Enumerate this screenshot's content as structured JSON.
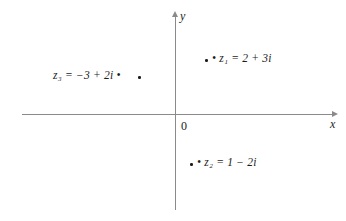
{
  "diagram": {
    "type": "complex-plane-argand-diagram",
    "axes": {
      "x_label": "x",
      "y_label": "y",
      "origin_label": "0"
    },
    "points": [
      {
        "id": "z1",
        "label": "• z₁ = 2 + 3i",
        "name": "z₁",
        "expression": "2 + 3i",
        "real": 2,
        "imaginary": 3,
        "dot_side": "left"
      },
      {
        "id": "z2",
        "label": "• z₂ = 1 − 2i",
        "name": "z₂",
        "expression": "1 − 2i",
        "real": 1,
        "imaginary": -2,
        "dot_side": "left"
      },
      {
        "id": "z3",
        "label": "z₃ = −3 + 2i •",
        "name": "z₃",
        "expression": "−3 + 2i",
        "real": -3,
        "imaginary": 2,
        "dot_side": "right"
      }
    ],
    "colors": {
      "axis": "#8a8a8a",
      "text": "#1c1c1c",
      "background": "#ffffff"
    }
  }
}
